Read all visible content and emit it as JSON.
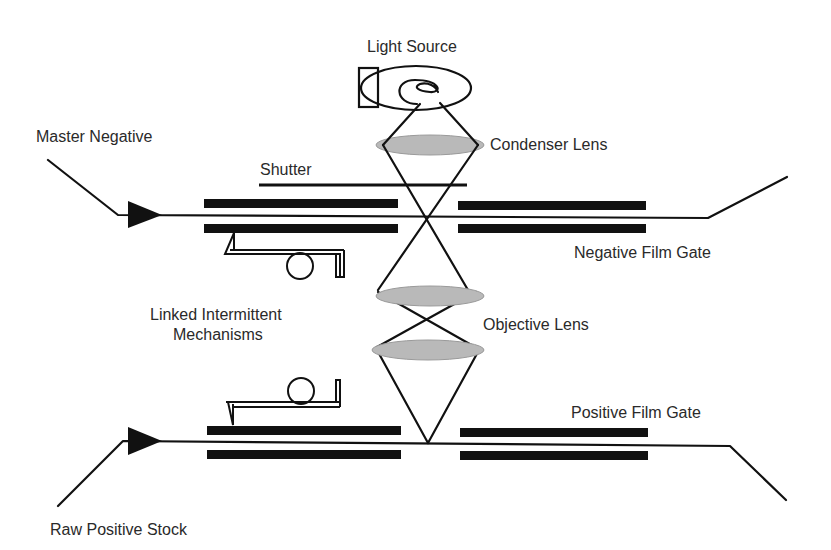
{
  "diagram": {
    "type": "optical printer schematic",
    "labels": {
      "light_source": "Light Source",
      "condenser_lens": "Condenser Lens",
      "shutter": "Shutter",
      "master_negative": "Master Negative",
      "negative_film_gate": "Negative Film Gate",
      "linked_mechanisms_line1": "Linked Intermittent",
      "linked_mechanisms_line2": "Mechanisms",
      "objective_lens": "Objective Lens",
      "positive_film_gate": "Positive Film Gate",
      "raw_positive_stock": "Raw Positive Stock"
    },
    "colors": {
      "line": "#111111",
      "lens_fill": "#b9b9b9",
      "text": "#2a2a2a",
      "background": "#ffffff"
    }
  }
}
